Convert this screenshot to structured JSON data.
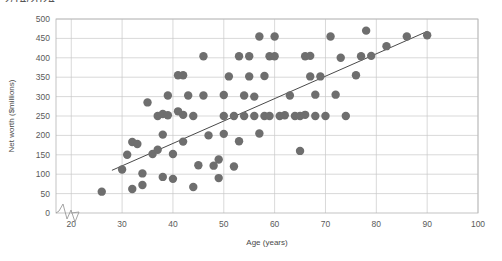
{
  "title_fragment": "2/14/2024,",
  "chart_data": {
    "type": "scatter",
    "title": "",
    "xlabel": "Age (years)",
    "ylabel": "Net worth ($millions)",
    "xlim": [
      17,
      100
    ],
    "ylim": [
      0,
      500
    ],
    "xticks": [
      20,
      30,
      40,
      50,
      60,
      70,
      80,
      90,
      100
    ],
    "yticks": [
      0,
      50,
      100,
      150,
      200,
      250,
      300,
      350,
      400,
      450,
      500
    ],
    "grid": true,
    "legend": "none",
    "axis_break_x": true,
    "axis_break_y": true,
    "marker_color": "#6e6e6e",
    "marker_size": 4.2,
    "trendline": {
      "visible": true,
      "color": "#4a4a4a",
      "x_start": 28,
      "y_start": 110,
      "x_end": 90,
      "y_end": 468
    },
    "points": [
      [
        26,
        55
      ],
      [
        30,
        112
      ],
      [
        31,
        150
      ],
      [
        32,
        62
      ],
      [
        32,
        183
      ],
      [
        33,
        178
      ],
      [
        34,
        102
      ],
      [
        34,
        72
      ],
      [
        35,
        285
      ],
      [
        36,
        152
      ],
      [
        37,
        163
      ],
      [
        37,
        250
      ],
      [
        38,
        93
      ],
      [
        38,
        202
      ],
      [
        38,
        255
      ],
      [
        39,
        252
      ],
      [
        39,
        303
      ],
      [
        40,
        152
      ],
      [
        40,
        88
      ],
      [
        41,
        262
      ],
      [
        41,
        355
      ],
      [
        42,
        184
      ],
      [
        42,
        253
      ],
      [
        42,
        355
      ],
      [
        43,
        303
      ],
      [
        44,
        67
      ],
      [
        44,
        250
      ],
      [
        45,
        123
      ],
      [
        46,
        303
      ],
      [
        46,
        404
      ],
      [
        47,
        200
      ],
      [
        48,
        122
      ],
      [
        49,
        90
      ],
      [
        49,
        138
      ],
      [
        50,
        204
      ],
      [
        50,
        250
      ],
      [
        50,
        304
      ],
      [
        51,
        352
      ],
      [
        52,
        120
      ],
      [
        52,
        250
      ],
      [
        53,
        185
      ],
      [
        53,
        404
      ],
      [
        54,
        250
      ],
      [
        54,
        303
      ],
      [
        55,
        352
      ],
      [
        55,
        404
      ],
      [
        56,
        250
      ],
      [
        56,
        300
      ],
      [
        57,
        205
      ],
      [
        57,
        455
      ],
      [
        58,
        250
      ],
      [
        58,
        353
      ],
      [
        59,
        250
      ],
      [
        59,
        404
      ],
      [
        60,
        404
      ],
      [
        60,
        455
      ],
      [
        61,
        250
      ],
      [
        62,
        252
      ],
      [
        63,
        303
      ],
      [
        64,
        250
      ],
      [
        65,
        160
      ],
      [
        65,
        250
      ],
      [
        66,
        404
      ],
      [
        66,
        253
      ],
      [
        67,
        352
      ],
      [
        67,
        405
      ],
      [
        68,
        250
      ],
      [
        68,
        305
      ],
      [
        69,
        352
      ],
      [
        70,
        250
      ],
      [
        71,
        455
      ],
      [
        72,
        305
      ],
      [
        73,
        400
      ],
      [
        74,
        250
      ],
      [
        76,
        355
      ],
      [
        77,
        404
      ],
      [
        78,
        470
      ],
      [
        79,
        405
      ],
      [
        82,
        430
      ],
      [
        86,
        455
      ],
      [
        90,
        458
      ]
    ]
  }
}
